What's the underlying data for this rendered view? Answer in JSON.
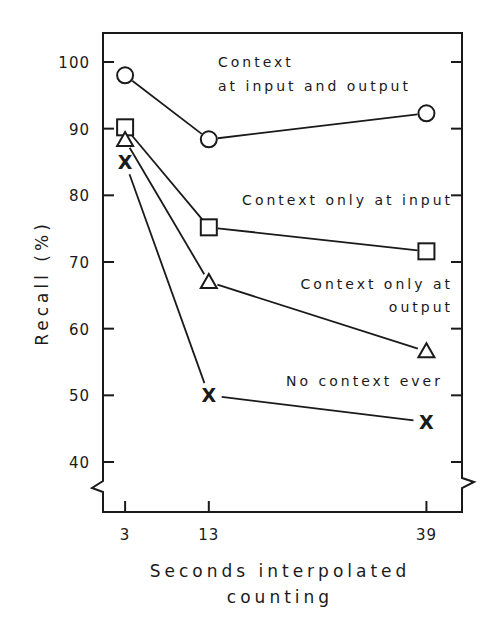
{
  "chart_data": {
    "type": "line",
    "title": "",
    "xlabel": "Seconds interpolated counting",
    "xlabel_lines": [
      "Seconds interpolated",
      "counting"
    ],
    "ylabel": "Recall (%)",
    "x": [
      3,
      13,
      39
    ],
    "x_tick_labels": [
      "3",
      "13",
      "39"
    ],
    "y_ticks": [
      40,
      50,
      60,
      70,
      80,
      90,
      100
    ],
    "y_tick_labels": [
      "40",
      "50",
      "60",
      "70",
      "80",
      "90",
      "100"
    ],
    "ylim": [
      35,
      103
    ],
    "y_axis_break": true,
    "grid": false,
    "legend_position": "inline labels next to lines",
    "series": [
      {
        "name": "Context at input and output",
        "label_lines": [
          "Context",
          "at input and output"
        ],
        "marker": "circle",
        "values": [
          98,
          88.4,
          92.3
        ]
      },
      {
        "name": "Context only at input",
        "label_lines": [
          "Context only at input"
        ],
        "marker": "square",
        "values": [
          90.2,
          75.2,
          71.6
        ]
      },
      {
        "name": "Context only at output",
        "label_lines": [
          "Context only at",
          "output"
        ],
        "marker": "triangle",
        "values": [
          88.3,
          67.0,
          56.6
        ]
      },
      {
        "name": "No context ever",
        "label_lines": [
          "No context ever"
        ],
        "marker": "x",
        "values": [
          85.0,
          50.0,
          46.0
        ]
      }
    ]
  }
}
